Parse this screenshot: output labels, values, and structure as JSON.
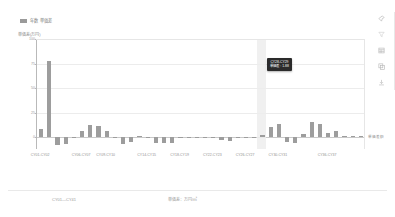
{
  "legend": {
    "label": "年数 単価差",
    "swatch_color": "#9d9d9d"
  },
  "chart_data": {
    "type": "bar",
    "title": "年数 単価差",
    "xlabel": "",
    "ylabel": "単価差(万円)",
    "ylim": [
      -12,
      100
    ],
    "yticks": [
      0,
      25,
      50,
      75,
      100
    ],
    "ytick_labels": [
      "0",
      "25",
      "50",
      "75",
      "100"
    ],
    "grid": true,
    "legend_position": "top-left",
    "series_label": "単価差額",
    "categories": [
      "CY01-CY02",
      "CY02-CY03",
      "CY03-CY04",
      "CY04-CY05",
      "CY05-CY06",
      "CY06-CY07",
      "CY07-CY08",
      "CY08-CY09",
      "CY09-CY10",
      "CY10-CY11",
      "CY11-CY12",
      "CY12-CY13",
      "CY13-CY14",
      "CY14-CY15",
      "CY15-CY16",
      "CY16-CY17",
      "CY17-CY18",
      "CY18-CY19",
      "CY19-CY20",
      "CY20-CY21",
      "CY21-CY22",
      "CY22-CY23",
      "CY23-CY24",
      "CY24-CY25",
      "CY25-CY26",
      "CY26-CY27",
      "CY27-CY28",
      "CY28-CY29",
      "CY29-CY30",
      "CY30-CY31",
      "CY31-CY32",
      "CY32-CY33",
      "CY33-CY34",
      "CY34-CY35",
      "CY35-CY36",
      "CY36-CY37",
      "CY37-CY38",
      "CY38-CY39",
      "CY39-CY40",
      "CY40-CY41"
    ],
    "xtick_labels": [
      "CY01-CY02",
      "CY06-CY07",
      "CY09-CY10",
      "CY14-CY15",
      "CY18-CY19",
      "CY22-CY23",
      "CY26-CY27",
      "CY30-CY31",
      "CY36-CY37"
    ],
    "xtick_indices": [
      0,
      5,
      8,
      13,
      17,
      21,
      25,
      29,
      35
    ],
    "values": [
      8.0,
      78.0,
      -7.5,
      -7.0,
      0.0,
      6.5,
      12.0,
      11.0,
      6.0,
      -0.5,
      -6.5,
      -4.5,
      1.0,
      -0.5,
      -6.0,
      -5.5,
      -5.5,
      -0.5,
      -1.0,
      -1.0,
      -1.2,
      -0.8,
      -3.0,
      -3.5,
      -0.6,
      0.5,
      -0.4,
      1.88,
      10.0,
      13.0,
      -5.0,
      -5.5,
      3.5,
      16.0,
      13.5,
      4.0,
      6.5,
      1.5,
      1.0,
      0.8
    ],
    "bar_color": "#9d9d9d",
    "highlight_index": 27,
    "highlight_color": "#ededed"
  },
  "tooltip": {
    "visible": true,
    "title": "CY28-CY29",
    "value_line": "単価差 : 1.88"
  },
  "toolbar": {
    "items": [
      {
        "icon": "pin-icon",
        "label": "固定"
      },
      {
        "icon": "filter-icon",
        "label": "フィルタ"
      },
      {
        "icon": "table-icon",
        "label": "表"
      },
      {
        "icon": "copy-icon",
        "label": "コピー"
      },
      {
        "icon": "download-icon",
        "label": "保存"
      }
    ]
  },
  "footer": {
    "left_label": "CY01—CY41",
    "right_label": "単価差：万円/㎡"
  }
}
